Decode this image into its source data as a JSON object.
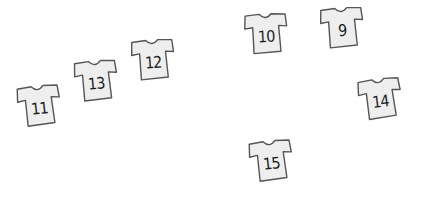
{
  "scene": {
    "background": "#ffffff",
    "shirt_fill": "#eeeeee",
    "shirt_outline": "#555555",
    "number_color": "#1e1e1e"
  },
  "shirts": [
    {
      "number": "11",
      "left": 16,
      "top": 84,
      "rotate": -6
    },
    {
      "number": "13",
      "left": 73,
      "top": 59,
      "rotate": -5
    },
    {
      "number": "12",
      "left": 130,
      "top": 38,
      "rotate": -4
    },
    {
      "number": "10",
      "left": 243,
      "top": 12,
      "rotate": -3
    },
    {
      "number": "9",
      "left": 319,
      "top": 6,
      "rotate": -4
    },
    {
      "number": "14",
      "left": 357,
      "top": 77,
      "rotate": -7
    },
    {
      "number": "15",
      "left": 248,
      "top": 139,
      "rotate": -6
    }
  ]
}
